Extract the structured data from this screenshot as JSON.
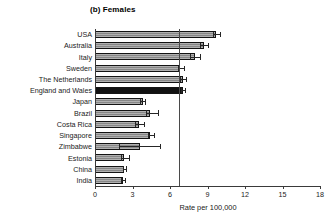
{
  "chart_data": {
    "type": "bar",
    "orientation": "horizontal",
    "title": "(b) Females",
    "xlabel": "Rate per 100,000",
    "ylabel": "",
    "xlim": [
      0,
      18
    ],
    "xticks": [
      0,
      3,
      6,
      9,
      12,
      15,
      18
    ],
    "xtick_labels": [
      "0",
      "3",
      "6",
      "9",
      "12",
      "15",
      "18"
    ],
    "grid": false,
    "legend": "none",
    "reference_line": {
      "value": 6.7,
      "orientation": "vertical",
      "color": "#4a4a4a"
    },
    "highlight_color": "#111111",
    "bar_color": "#8f8f8f",
    "categories": [
      "USA",
      "Australia",
      "Italy",
      "Sweden",
      "The Netherlands",
      "England and Wales",
      "Japan",
      "Brazil",
      "Costa Rica",
      "Singapore",
      "Zimbabwe",
      "Estonia",
      "China",
      "India"
    ],
    "values": [
      9.7,
      8.7,
      8.0,
      6.8,
      7.0,
      7.0,
      3.8,
      4.4,
      3.5,
      4.4,
      3.6,
      2.3,
      2.3,
      2.2
    ],
    "ci_low": [
      9.4,
      8.4,
      7.6,
      6.6,
      6.8,
      6.9,
      3.6,
      4.1,
      3.2,
      4.2,
      1.9,
      2.1,
      2.2,
      2.1
    ],
    "ci_high": [
      10.0,
      9.0,
      8.4,
      7.1,
      7.3,
      7.2,
      4.0,
      5.0,
      3.9,
      4.7,
      5.2,
      2.7,
      2.5,
      2.4
    ],
    "highlighted": [
      "England and Wales"
    ]
  }
}
